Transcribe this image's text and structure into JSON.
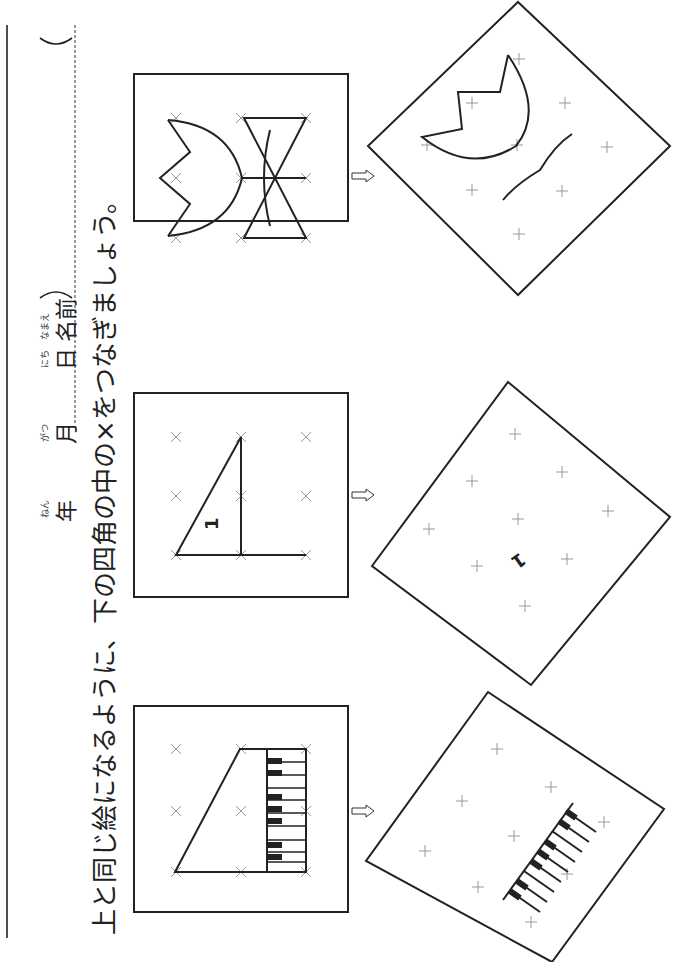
{
  "header": {
    "year_label": "年",
    "year_ruby": "ねん",
    "month_label": "月",
    "month_ruby": "がつ",
    "day_label": "日",
    "day_ruby": "にち",
    "name_label": "名前",
    "name_ruby": "なまえ",
    "name_open_paren": "(",
    "name_close_paren": ")"
  },
  "instruction": {
    "part1": "上と同じ絵になるように、",
    "part1_ruby": [
      "うえ",
      "おな",
      "え"
    ],
    "part2": "下の四角の中の×をつなぎましょう。",
    "part2_ruby": [
      "した",
      "しかく",
      "なか"
    ]
  },
  "exercises": [
    {
      "id": "piano",
      "model_picture": "piano (trapezoid with keyboard)",
      "target_picture": "rotated partial piano keyboard"
    },
    {
      "id": "triangle",
      "model_picture": "right triangle with digit",
      "model_label": "1",
      "target_picture": "rotated grid with digit",
      "target_label": "1"
    },
    {
      "id": "tulip-bow",
      "model_picture": "tulip and bow",
      "target_picture": "rotated partial tulip and stem"
    }
  ],
  "arrow_glyph": "⇨",
  "colors": {
    "ink": "#222222",
    "grid_mark": "#999999",
    "background": "#ffffff"
  }
}
